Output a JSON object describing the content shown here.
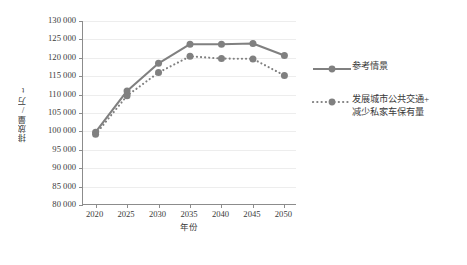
{
  "chart_data": {
    "type": "line",
    "title": "",
    "xlabel": "年份",
    "ylabel": "排放量/万t",
    "x": [
      2020,
      2025,
      2030,
      2035,
      2040,
      2045,
      2050
    ],
    "xticklabels": [
      "2020",
      "2025",
      "2030",
      "2035",
      "2040",
      "2045",
      "2050"
    ],
    "xlim": [
      2018,
      2052
    ],
    "ylim": [
      80000,
      130000
    ],
    "yticks": [
      80000,
      85000,
      90000,
      95000,
      100000,
      105000,
      110000,
      115000,
      120000,
      125000,
      130000
    ],
    "yticklabels": [
      "80 000",
      "85 000",
      "90 000",
      "95 000",
      "100 000",
      "105 000",
      "110 000",
      "115 000",
      "120 000",
      "125 000",
      "130 000"
    ],
    "grid": "horizontal",
    "legend_position": "right",
    "series": [
      {
        "name": "参考情景",
        "style": "solid",
        "color": "#808080",
        "marker": "circle",
        "values": [
          99800,
          111000,
          118500,
          123700,
          123700,
          123900,
          120600
        ]
      },
      {
        "name": "发展城市公共交通+\n减少私家车保有量",
        "style": "dotted",
        "color": "#808080",
        "marker": "circle",
        "values": [
          99200,
          109700,
          116000,
          120400,
          119800,
          119700,
          115200
        ]
      }
    ]
  },
  "legend": {
    "entries": [
      {
        "label": "参考情景",
        "key": "solid-line-marker"
      },
      {
        "label": "发展城市公共交通+\n减少私家车保有量",
        "key": "dotted-line-marker"
      }
    ]
  },
  "colors": {
    "series": "#808080",
    "axis": "#8c8c8c",
    "grid": "#ededed",
    "text": "#3a3a3a",
    "background": "#ffffff"
  }
}
